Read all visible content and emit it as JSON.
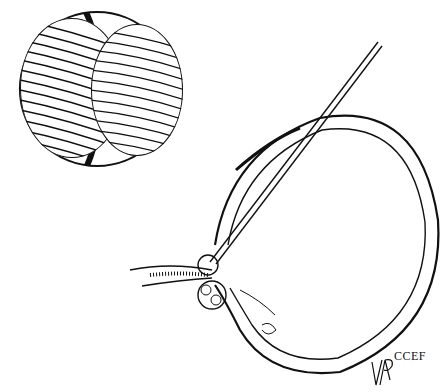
{
  "illustration": {
    "subject": "two-cell embryo and ovarian follicle with aspiration needle",
    "credit_text": "CCEF",
    "signature": "VAP",
    "colors": {
      "ink": "#111111",
      "background": "#ffffff"
    }
  }
}
